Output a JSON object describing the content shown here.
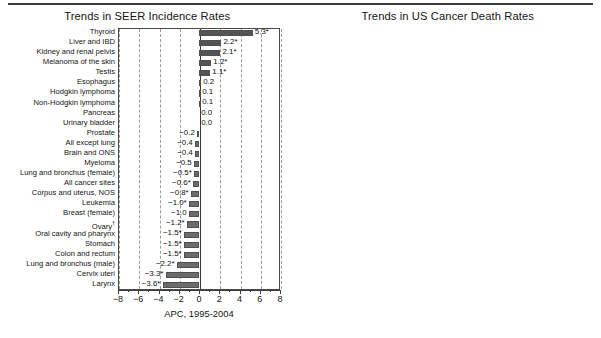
{
  "figure": {
    "axis_title": "APC, 1995-2004",
    "xlim": [
      -8,
      8
    ],
    "xticks": [
      -8,
      -6,
      -4,
      -2,
      0,
      2,
      4,
      6,
      8
    ],
    "xtick_labels": [
      "−8",
      "−6",
      "−4",
      "−2",
      "0",
      "2",
      "4",
      "6",
      "8"
    ],
    "bar_color": "#6b6b6b",
    "grid_color": "#9a9a9a",
    "frame_color": "#4a4a4a"
  },
  "chart_data": [
    {
      "type": "bar",
      "title": "Trends in SEER Incidence Rates",
      "xlabel": "APC, 1995-2004",
      "ylabel": "",
      "xlim": [
        -8,
        8
      ],
      "orientation": "horizontal",
      "grid": true,
      "legend": "none",
      "categories": [
        "Thyroid",
        "Liver and IBD",
        "Kidney and renal pelvis",
        "Melanoma of the skin",
        "Testis",
        "Esophagus",
        "Hodgkin lymphoma",
        "Non-Hodgkin lymphoma",
        "Pancreas",
        "Urinary bladder",
        "Prostate",
        "All except lung",
        "Brain and ONS",
        "Myeloma",
        "Lung and bronchus (female)",
        "All cancer sites",
        "Corpus and uterus, NOS",
        "Leukemia",
        "Breast (female)",
        "Ovary",
        "Oral cavity and pharynx",
        "Stomach",
        "Colon and rectum",
        "Lung and bronchus (male)",
        "Cervix uteri",
        "Larynx"
      ],
      "category_marks": [
        "",
        "",
        "",
        "",
        "",
        "",
        "",
        "",
        "",
        "",
        "",
        "",
        "",
        "",
        "",
        "",
        "",
        "",
        "",
        "†",
        "",
        "",
        "",
        "",
        "",
        ""
      ],
      "values": [
        5.3,
        2.2,
        2.1,
        1.2,
        1.1,
        0.2,
        0.1,
        0.1,
        0.0,
        0.0,
        -0.2,
        -0.4,
        -0.4,
        -0.5,
        -0.5,
        -0.6,
        -0.8,
        -1.0,
        -1.0,
        -1.2,
        -1.5,
        -1.5,
        -1.5,
        -2.2,
        -3.3,
        -3.6
      ],
      "value_labels": [
        "5.3*",
        "2.2*",
        "2.1*",
        "1.2*",
        "1.1*",
        "0.2",
        "0.1",
        "0.1",
        "0.0",
        "0.0",
        "−0.2",
        "−0.4",
        "−0.4",
        "−0.5",
        "−0.5*",
        "−0.6*",
        "−0.8*",
        "−1.0*",
        "−1.0",
        "−1.2*",
        "−1.5*",
        "−1.5*",
        "−1.5*",
        "−2.2*",
        "−3.3*",
        "−3.6*"
      ]
    },
    {
      "type": "bar",
      "title": "Trends in US Cancer Death Rates",
      "xlabel": "APC, 1995-2004",
      "ylabel": "",
      "xlim": [
        -8,
        8
      ],
      "orientation": "horizontal",
      "grid": true,
      "legend": "none",
      "categories": [
        "Liver and IBD",
        "Thyroid",
        "Esophagus",
        "Lung and bronchus (female)",
        "Pancreas",
        "Testis",
        "Corpus and uterus, NOS",
        "Ovary",
        "Urinary bladder",
        "Kidney and renal pelvis",
        "Melanoma of the skin",
        "Leukemia",
        "Myeloma",
        "Brain and ONS",
        "All cancer sites",
        "All except lung",
        "Lung and bronchus (male)",
        "Oral cavity and pharynx",
        "Colon and rectum",
        "Larynx",
        "Breast (female)",
        "Hodgkin lymphoma",
        "Non-Hodgkin lymphoma",
        "Stomach",
        "Cervix uteri",
        "Prostate"
      ],
      "category_marks": [
        "",
        "",
        "",
        "",
        "",
        "",
        "",
        "",
        "",
        "",
        "",
        "",
        "",
        "",
        "",
        "",
        "",
        "",
        "",
        "",
        "",
        "",
        "",
        "",
        "",
        ""
      ],
      "values": [
        1.7,
        0.6,
        0.3,
        0.2,
        0.1,
        0.1,
        0.1,
        -0.1,
        -0.2,
        -0.4,
        -0.5,
        -0.8,
        -0.9,
        -1.0,
        -1.2,
        -1.3,
        -2.0,
        -2.1,
        -2.2,
        -2.2,
        -2.3,
        -2.4,
        -2.5,
        -3.2,
        -3.5,
        -4.1
      ],
      "value_labels": [
        "1.7*",
        "0.6",
        "0.3*",
        "0.2*",
        "0.1*",
        "0.1",
        "0.1",
        "−0.1",
        "−0.2",
        "−0.4",
        "−0.5*",
        "−0.8*",
        "−0.9*",
        "−1.0*",
        "−1.2*",
        "−1.3*",
        "−2.0*",
        "−2.1*",
        "−2.2*",
        "−2.2*",
        "−2.3*",
        "−2.4*",
        "−2.5*",
        "−3.2*",
        "−3.5*",
        "−4.1*"
      ]
    }
  ]
}
